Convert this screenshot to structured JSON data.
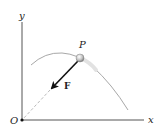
{
  "diagram": {
    "axes": {
      "x_label": "x",
      "y_label": "y",
      "origin_label": "O"
    },
    "point": {
      "label": "P"
    },
    "force": {
      "label": "F"
    },
    "colors": {
      "axis": "#555555",
      "curve": "#a8a8a8",
      "arrow": "#111111",
      "dashed": "#bbbbbb",
      "particle": "#c8c8c8"
    }
  }
}
